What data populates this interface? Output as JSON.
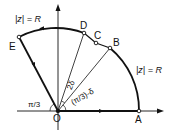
{
  "diagram": {
    "colors": {
      "stroke": "#111111",
      "background": "#ffffff"
    },
    "points": {
      "O": {
        "label": "O",
        "x": 58,
        "y": 111
      },
      "A": {
        "label": "A",
        "x": 139,
        "y": 111
      },
      "B": {
        "label": "B",
        "x": 110,
        "y": 48
      },
      "C": {
        "label": "C",
        "x": 96,
        "y": 43
      },
      "D": {
        "label": "D",
        "x": 84,
        "y": 33
      },
      "E": {
        "label": "E",
        "x": 19,
        "y": 37
      }
    },
    "labels": {
      "arc_top": "|z| = R",
      "arc_right": "|z| = R",
      "angle_left": "π/3",
      "angle_2delta": "2δ",
      "angle_right": "(π/3)-δ"
    },
    "edges": [
      {
        "from": "O",
        "to": "A",
        "type": "segment",
        "arrow": true
      },
      {
        "from": "A",
        "to": "B",
        "type": "arc",
        "label": "|z| = R"
      },
      {
        "from": "B",
        "to": "C",
        "type": "segment"
      },
      {
        "from": "C",
        "to": "D",
        "type": "segment"
      },
      {
        "from": "D",
        "to": "E",
        "type": "arc",
        "label": "|z| = R",
        "arrow": true
      },
      {
        "from": "E",
        "to": "O",
        "type": "segment",
        "arrow": true
      },
      {
        "from": "O",
        "to": "B",
        "type": "ray",
        "thin": true
      },
      {
        "from": "O",
        "to": "D",
        "type": "ray",
        "thin": true
      }
    ],
    "axes": {
      "x_axis": true,
      "y_axis": true
    }
  }
}
